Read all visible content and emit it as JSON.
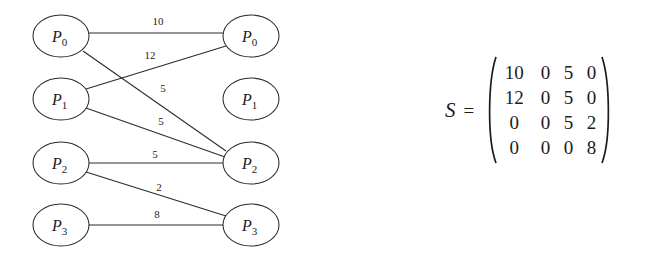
{
  "figure": {
    "type": "bipartite-graph",
    "left_nodes": [
      {
        "id": "L0",
        "label": "P",
        "sub": "0",
        "cx": 61,
        "cy": 36,
        "rx": 28,
        "ry": 21
      },
      {
        "id": "L1",
        "label": "P",
        "sub": "1",
        "cx": 61,
        "cy": 99,
        "rx": 28,
        "ry": 21
      },
      {
        "id": "L2",
        "label": "P",
        "sub": "2",
        "cx": 61,
        "cy": 163,
        "rx": 28,
        "ry": 21
      },
      {
        "id": "L3",
        "label": "P",
        "sub": "3",
        "cx": 61,
        "cy": 225,
        "rx": 28,
        "ry": 21
      }
    ],
    "right_nodes": [
      {
        "id": "R0",
        "label": "P",
        "sub": "0",
        "cx": 251,
        "cy": 36,
        "rx": 28,
        "ry": 21
      },
      {
        "id": "R1",
        "label": "P",
        "sub": "1",
        "cx": 251,
        "cy": 99,
        "rx": 28,
        "ry": 21
      },
      {
        "id": "R2",
        "label": "P",
        "sub": "2",
        "cx": 251,
        "cy": 163,
        "rx": 28,
        "ry": 21
      },
      {
        "id": "R3",
        "label": "P",
        "sub": "3",
        "cx": 251,
        "cy": 225,
        "rx": 28,
        "ry": 21
      }
    ],
    "edges": [
      {
        "from": "L0",
        "to": "R0",
        "weight": "10",
        "x1": 89,
        "y1": 33,
        "x2": 223,
        "y2": 33,
        "lx": 158,
        "ly": 25
      },
      {
        "from": "L1",
        "to": "R0",
        "weight": "12",
        "x1": 86,
        "y1": 89,
        "x2": 226,
        "y2": 46,
        "lx": 150,
        "ly": 59
      },
      {
        "from": "L0",
        "to": "R2",
        "weight": "5",
        "x1": 83,
        "y1": 51,
        "x2": 226,
        "y2": 151,
        "lx": 163,
        "ly": 92
      },
      {
        "from": "L1",
        "to": "R2",
        "weight": "5",
        "x1": 86,
        "y1": 108,
        "x2": 225,
        "y2": 157,
        "lx": 161,
        "ly": 125
      },
      {
        "from": "L2",
        "to": "R2",
        "weight": "5",
        "x1": 89,
        "y1": 163,
        "x2": 223,
        "y2": 163,
        "lx": 155,
        "ly": 158
      },
      {
        "from": "L2",
        "to": "R3",
        "weight": "2",
        "x1": 86,
        "y1": 172,
        "x2": 226,
        "y2": 216,
        "lx": 159,
        "ly": 191
      },
      {
        "from": "L3",
        "to": "R3",
        "weight": "8",
        "x1": 89,
        "y1": 225,
        "x2": 223,
        "y2": 225,
        "lx": 157,
        "ly": 218
      }
    ]
  },
  "matrix": {
    "symbol": "S",
    "equals": "=",
    "rows": [
      [
        "10",
        "0",
        "5",
        "0"
      ],
      [
        "12",
        "0",
        "5",
        "0"
      ],
      [
        "0",
        "0",
        "5",
        "2"
      ],
      [
        "0",
        "0",
        "0",
        "8"
      ]
    ]
  }
}
